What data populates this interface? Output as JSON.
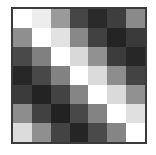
{
  "chart_data": {
    "type": "heatmap",
    "title": "",
    "subtitle": "",
    "xlabel": "",
    "ylabel": "",
    "grid": false,
    "legend": false,
    "legend_position": "none",
    "colormap": "grayscale",
    "colormap_description": "value 0 = black, value 1 = white",
    "vmin": 0,
    "vmax": 1,
    "n_rows": 7,
    "n_cols": 7,
    "xticklabels": [],
    "yticklabels": [],
    "row_labels": [
      "1",
      "2",
      "3",
      "4",
      "5",
      "6",
      "7"
    ],
    "col_labels": [
      "1",
      "2",
      "3",
      "4",
      "5",
      "6",
      "7"
    ],
    "values": [
      [
        1.0,
        0.93,
        0.6,
        0.27,
        0.16,
        0.24,
        0.54
      ],
      [
        0.56,
        1.0,
        0.87,
        0.53,
        0.25,
        0.13,
        0.22
      ],
      [
        0.28,
        0.5,
        1.0,
        0.85,
        0.57,
        0.23,
        0.14
      ],
      [
        0.14,
        0.27,
        0.5,
        1.0,
        0.86,
        0.55,
        0.26
      ],
      [
        0.23,
        0.13,
        0.26,
        0.52,
        1.0,
        0.85,
        0.57
      ],
      [
        0.55,
        0.25,
        0.12,
        0.28,
        0.51,
        1.0,
        0.88
      ],
      [
        0.86,
        0.56,
        0.26,
        0.14,
        0.29,
        0.52,
        1.0
      ]
    ],
    "cell_colors": [
      [
        "#ffffff",
        "#ededed",
        "#9a9a9a",
        "#464646",
        "#2a2a2a",
        "#3e3e3e",
        "#8a8a8a"
      ],
      [
        "#8f8f8f",
        "#ffffff",
        "#e2e2e2",
        "#888888",
        "#414141",
        "#242424",
        "#3a3a3a"
      ],
      [
        "#494949",
        "#808080",
        "#ffffff",
        "#d9d9d9",
        "#919191",
        "#3c3c3c",
        "#272727"
      ],
      [
        "#272727",
        "#484848",
        "#828282",
        "#ffffff",
        "#dbdbdb",
        "#8d8d8d",
        "#434343"
      ],
      [
        "#3b3b3b",
        "#232323",
        "#434343",
        "#858585",
        "#ffffff",
        "#dadada",
        "#919191"
      ],
      [
        "#8d8d8d",
        "#414141",
        "#222222",
        "#484848",
        "#838383",
        "#ffffff",
        "#e0e0e0"
      ],
      [
        "#dcdcdc",
        "#8f8f8f",
        "#434343",
        "#252525",
        "#4a4a4a",
        "#858585",
        "#ffffff"
      ]
    ]
  },
  "figure": {
    "background_color": "#ffffff",
    "border_color": "#3a3a3a",
    "border_width_px": 2
  }
}
